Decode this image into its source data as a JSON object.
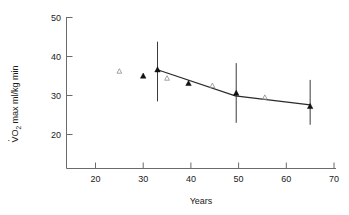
{
  "chart_data": {
    "type": "scatter",
    "title": "",
    "xlabel": "Years",
    "ylabel": "VO2 max ml/kg min",
    "ylabel_parts": {
      "v": "V",
      "o": "O",
      "sub": "2",
      "rest": " max  ml/kg  min"
    },
    "xlim": [
      14,
      71
    ],
    "ylim": [
      14,
      51
    ],
    "xticks": [
      20,
      30,
      40,
      50,
      60,
      70
    ],
    "xticklabels": [
      "20",
      "30",
      "40",
      "50",
      "60",
      "70"
    ],
    "yticks": [
      20,
      30,
      40,
      50
    ],
    "yticklabels": [
      "20",
      "30",
      "40",
      "50"
    ],
    "grid": false,
    "legend": "none",
    "series": [
      {
        "name": "longitudinal-mean-with-sd",
        "marker": "filled-triangle",
        "points": [
          {
            "x": 30.0,
            "y": 35.0,
            "err_low": null,
            "err_high": null
          },
          {
            "x": 33.0,
            "y": 36.6,
            "err_low": 28.5,
            "err_high": 43.8
          },
          {
            "x": 39.5,
            "y": 33.1,
            "err_low": null,
            "err_high": null
          },
          {
            "x": 49.5,
            "y": 30.6,
            "err_low": 23.0,
            "err_high": 38.3
          },
          {
            "x": 65.0,
            "y": 27.2,
            "err_low": 22.5,
            "err_high": 34.0
          }
        ]
      },
      {
        "name": "cross-sectional",
        "marker": "open-triangle",
        "points": [
          {
            "x": 25.0,
            "y": 36.2
          },
          {
            "x": 35.0,
            "y": 34.4
          },
          {
            "x": 44.5,
            "y": 32.5
          },
          {
            "x": 55.5,
            "y": 29.5
          }
        ]
      }
    ],
    "fit_line": {
      "name": "regression-fit",
      "points": [
        {
          "x": 33.0,
          "y": 36.6
        },
        {
          "x": 49.3,
          "y": 29.9
        },
        {
          "x": 65.0,
          "y": 27.6
        }
      ]
    }
  },
  "colors": {
    "axis": "#6b6b6b",
    "marker_filled": "#111111",
    "marker_open": "#8c8c8c",
    "line": "#2a2a2a",
    "text": "#1a1a1a",
    "background": "#ffffff"
  }
}
